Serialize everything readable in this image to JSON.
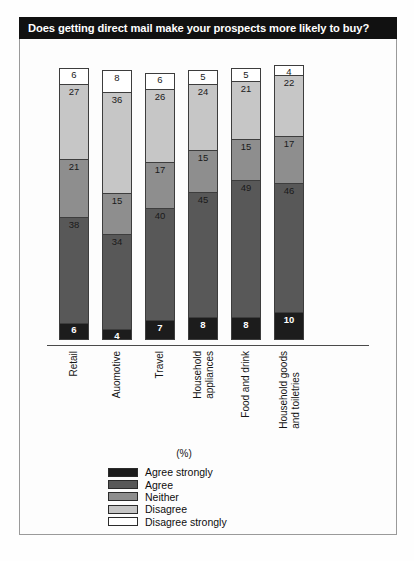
{
  "title": "Does getting direct mail make your prospects more likely to buy?",
  "axis_note": "(%)",
  "chart_data": {
    "type": "bar",
    "subtype": "stacked-column",
    "title": "Does getting direct mail make your prospects more likely to buy?",
    "xlabel": "",
    "ylabel": "(%)",
    "ylim": [
      0,
      100
    ],
    "grid": false,
    "legend_position": "bottom-left",
    "categories": [
      "Retail",
      "Auomotive",
      "Travel",
      "Household appliances",
      "Food and drink",
      "Household goods and toiletries"
    ],
    "category_lines": [
      [
        "Retail"
      ],
      [
        "Auomotive"
      ],
      [
        "Travel"
      ],
      [
        "Household",
        "appliances"
      ],
      [
        "Food and drink"
      ],
      [
        "Household goods",
        "and toiletries"
      ]
    ],
    "series": [
      {
        "name": "Agree strongly",
        "color": "#1c1c1c",
        "values": [
          6,
          4,
          7,
          8,
          8,
          10
        ]
      },
      {
        "name": "Agree",
        "color": "#585858",
        "values": [
          38,
          34,
          40,
          45,
          49,
          46
        ]
      },
      {
        "name": "Neither",
        "color": "#8e8e8e",
        "values": [
          21,
          15,
          17,
          15,
          15,
          17
        ]
      },
      {
        "name": "Disagree",
        "color": "#c6c6c6",
        "values": [
          27,
          36,
          26,
          24,
          21,
          22
        ]
      },
      {
        "name": "Disagree strongly",
        "color": "#ffffff",
        "values": [
          6,
          8,
          6,
          5,
          5,
          4
        ]
      }
    ],
    "totals": [
      98,
      97,
      96,
      97,
      98,
      99
    ]
  },
  "legend": [
    {
      "label": "Agree strongly",
      "color": "#1c1c1c"
    },
    {
      "label": "Agree",
      "color": "#585858"
    },
    {
      "label": "Neither",
      "color": "#8e8e8e"
    },
    {
      "label": "Disagree",
      "color": "#c6c6c6"
    },
    {
      "label": "Disagree strongly",
      "color": "#ffffff"
    }
  ]
}
